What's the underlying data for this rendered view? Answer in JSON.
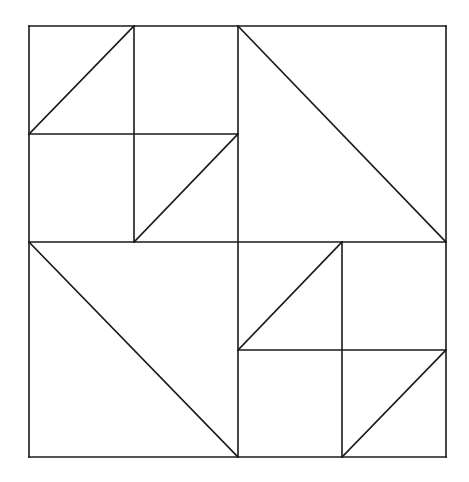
{
  "figure": {
    "background_color": "#ffffff",
    "stroke_color": "#1a1a1a",
    "stroke_width": 1.6,
    "canvas": {
      "width": 469,
      "height": 482
    },
    "bounds": {
      "left": 29,
      "top": 26,
      "right": 446,
      "bottom": 457
    },
    "center": {
      "x": 238,
      "y": 242
    }
  },
  "chart_data": {
    "type": "diagram",
    "xlabel": "",
    "ylabel": "",
    "xlim": [
      0,
      469
    ],
    "ylim": [
      0,
      482
    ],
    "grid": false,
    "legend": false,
    "shapes": [
      {
        "name": "outer-square",
        "type": "rect",
        "x": 29,
        "y": 26,
        "width": 417,
        "height": 431
      }
    ],
    "segments": [
      {
        "name": "outer-top",
        "x1": 29,
        "y1": 26,
        "x2": 446,
        "y2": 26
      },
      {
        "name": "outer-right",
        "x1": 446,
        "y1": 26,
        "x2": 446,
        "y2": 457
      },
      {
        "name": "outer-bottom",
        "x1": 29,
        "y1": 457,
        "x2": 446,
        "y2": 457
      },
      {
        "name": "outer-left",
        "x1": 29,
        "y1": 26,
        "x2": 29,
        "y2": 457
      },
      {
        "name": "center-vertical",
        "x1": 238,
        "y1": 26,
        "x2": 238,
        "y2": 457
      },
      {
        "name": "center-horizontal",
        "x1": 29,
        "y1": 242,
        "x2": 446,
        "y2": 242
      },
      {
        "name": "tl-inner-vertical",
        "x1": 134,
        "y1": 26,
        "x2": 134,
        "y2": 242
      },
      {
        "name": "tl-inner-horizontal",
        "x1": 29,
        "y1": 134,
        "x2": 238,
        "y2": 134
      },
      {
        "name": "tl-diagonal-upper",
        "x1": 29,
        "y1": 134,
        "x2": 134,
        "y2": 26
      },
      {
        "name": "tl-diagonal-lower",
        "x1": 134,
        "y1": 242,
        "x2": 238,
        "y2": 134
      },
      {
        "name": "tr-diagonal",
        "x1": 238,
        "y1": 26,
        "x2": 446,
        "y2": 242
      },
      {
        "name": "bl-diagonal",
        "x1": 29,
        "y1": 242,
        "x2": 238,
        "y2": 457
      },
      {
        "name": "br-inner-vertical",
        "x1": 342,
        "y1": 242,
        "x2": 342,
        "y2": 457
      },
      {
        "name": "br-inner-horizontal",
        "x1": 238,
        "y1": 350,
        "x2": 446,
        "y2": 350
      },
      {
        "name": "br-diagonal-upper",
        "x1": 238,
        "y1": 350,
        "x2": 342,
        "y2": 242
      },
      {
        "name": "br-diagonal-lower",
        "x1": 342,
        "y1": 457,
        "x2": 446,
        "y2": 350
      }
    ],
    "quadrants": [
      {
        "name": "top-left",
        "bounds": {
          "left": 29,
          "top": 26,
          "right": 238,
          "bottom": 242
        },
        "pattern": "pinwheel-four-cell",
        "triangle_count": 2
      },
      {
        "name": "top-right",
        "bounds": {
          "left": 238,
          "top": 26,
          "right": 446,
          "bottom": 242
        },
        "pattern": "single-diagonal",
        "triangle_count": 2
      },
      {
        "name": "bottom-left",
        "bounds": {
          "left": 29,
          "top": 242,
          "right": 238,
          "bottom": 457
        },
        "pattern": "single-diagonal",
        "triangle_count": 2
      },
      {
        "name": "bottom-right",
        "bounds": {
          "left": 238,
          "top": 242,
          "right": 446,
          "bottom": 457
        },
        "pattern": "pinwheel-four-cell",
        "triangle_count": 2
      }
    ]
  }
}
